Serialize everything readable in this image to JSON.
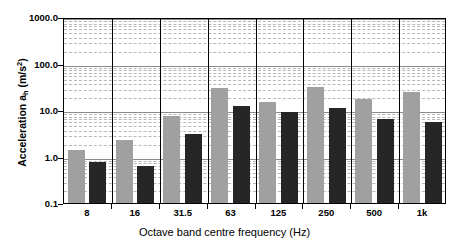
{
  "chart_data": {
    "type": "bar",
    "title": "",
    "xlabel": "Octave band centre frequency (Hz)",
    "ylabel": "Acceleration a",
    "ylabel_sub": "h",
    "ylabel_unit": " (m/s",
    "ylabel_sup": "2",
    "ylabel_close": ")",
    "categories": [
      "8",
      "16",
      "31.5",
      "63",
      "125",
      "250",
      "500",
      "1k"
    ],
    "yscale": "log",
    "ylim": [
      0.1,
      1000.0
    ],
    "ytick_labels": [
      "1000.0",
      "100.0",
      "10.0",
      "1.0",
      "0.1"
    ],
    "ytick_values": [
      1000.0,
      100.0,
      10.0,
      1.0,
      0.1
    ],
    "grid": true,
    "legend": "none",
    "series": [
      {
        "name": "grey",
        "color": "#a0a0a0",
        "values": [
          1.4,
          2.3,
          7.5,
          30.0,
          15.0,
          32.0,
          17.0,
          25.0
        ]
      },
      {
        "name": "black",
        "color": "#262626",
        "values": [
          0.75,
          0.63,
          3.0,
          12.0,
          9.0,
          11.0,
          6.3,
          5.5
        ]
      }
    ]
  }
}
